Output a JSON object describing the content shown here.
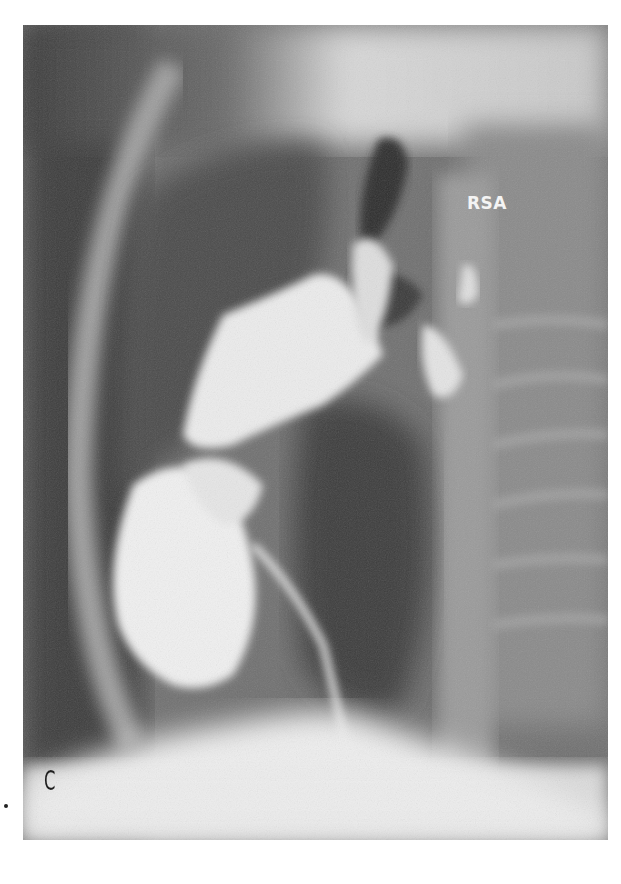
{
  "figure": {
    "panel_label": "C",
    "annotations": [
      {
        "text": "RSA"
      }
    ],
    "colors": {
      "background": "#ffffff",
      "dark_tissue": "#4a4a4a",
      "mid_tissue": "#7a7a7a",
      "contrast_bright": "#f2f2f2"
    }
  }
}
